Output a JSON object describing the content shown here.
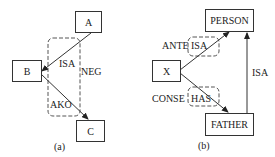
{
  "panels": [
    {
      "caption": "(a)",
      "nodes": {
        "A": "A",
        "B": "B",
        "C": "C"
      },
      "edges": [
        {
          "from": "A",
          "to": "B",
          "label": "ISA"
        },
        {
          "from": "B",
          "to": "C",
          "label": "AKO"
        }
      ],
      "group_label": "NEG"
    },
    {
      "caption": "(b)",
      "nodes": {
        "PERSON": "PERSON",
        "X": "X",
        "FATHER": "FATHER"
      },
      "edges": [
        {
          "from": "X",
          "to": "PERSON",
          "label": "ISA",
          "group_label": "ANTE"
        },
        {
          "from": "X",
          "to": "FATHER",
          "label": "HAS",
          "group_label": "CONSE"
        },
        {
          "from": "FATHER",
          "to": "PERSON",
          "label": "ISA"
        }
      ]
    }
  ]
}
